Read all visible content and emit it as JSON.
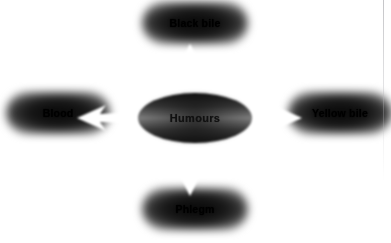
{
  "figure": {
    "type": "radial-concept-diagram",
    "background_color": "#ffffff",
    "width": 391,
    "height": 243
  },
  "hub": {
    "label": "Humours",
    "shape": "ellipse",
    "outline_color": "#ffffff",
    "fill_color": "#3a3a3a",
    "text_color": "#111111"
  },
  "nodes": [
    {
      "id": "black-bile",
      "label": "Black bile",
      "position": "top",
      "shape": "rounded-rectangle",
      "fill_color": "#141414",
      "text_color": "#000000"
    },
    {
      "id": "blood",
      "label": "Blood",
      "position": "left",
      "shape": "rounded-rectangle",
      "fill_color": "#141414",
      "text_color": "#000000"
    },
    {
      "id": "yellow-bile",
      "label": "Yellow bile",
      "position": "right",
      "shape": "rounded-rectangle",
      "fill_color": "#141414",
      "text_color": "#000000"
    },
    {
      "id": "phlegm",
      "label": "Phlegm",
      "position": "bottom",
      "shape": "rounded-rectangle",
      "fill_color": "#141414",
      "text_color": "#000000"
    }
  ],
  "connectors": [
    {
      "id": "arrow-up",
      "from": "Humours",
      "to": "Black bile",
      "direction": "up",
      "style": "block-arrow",
      "color": "#ffffff"
    },
    {
      "id": "arrow-left",
      "from": "Humours",
      "to": "Blood",
      "direction": "left",
      "style": "block-arrow",
      "color": "#ffffff"
    },
    {
      "id": "arrow-right",
      "from": "Humours",
      "to": "Yellow bile",
      "direction": "right",
      "style": "block-arrow",
      "color": "#ffffff"
    },
    {
      "id": "arrow-down",
      "from": "Humours",
      "to": "Phlegm",
      "direction": "down",
      "style": "block-arrow",
      "color": "#ffffff"
    }
  ]
}
